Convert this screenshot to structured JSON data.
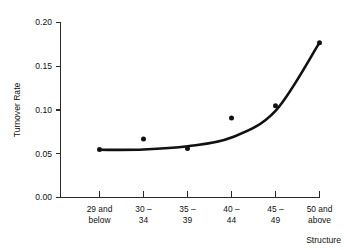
{
  "chart_data": {
    "type": "scatter",
    "title": "",
    "xlabel": "Structure",
    "ylabel": "Turnover Rate",
    "categories": [
      "29 and below",
      "30 – 34",
      "35 – 39",
      "40 – 44",
      "45 – 49",
      "50 and above"
    ],
    "category_lines": [
      [
        "29 and",
        "below"
      ],
      [
        "30 –",
        "34"
      ],
      [
        "35 –",
        "39"
      ],
      [
        "40 –",
        "44"
      ],
      [
        "45 –",
        "49"
      ],
      [
        "50 and",
        "above"
      ]
    ],
    "values": [
      0.055,
      0.067,
      0.056,
      0.091,
      0.105,
      0.177
    ],
    "series": [
      {
        "name": "Turnover Rate",
        "marker": "filled-circle",
        "values": [
          0.055,
          0.067,
          0.056,
          0.091,
          0.105,
          0.177
        ]
      },
      {
        "name": "Fitted curve",
        "type": "line",
        "values": [
          0.0545,
          0.0548,
          0.0585,
          0.0685,
          0.099,
          0.177
        ]
      }
    ],
    "ylim": [
      0.0,
      0.2
    ],
    "xlim": [
      0,
      5
    ],
    "yticks": [
      0.0,
      0.05,
      0.1,
      0.15,
      0.2
    ],
    "ytick_labels": [
      "0.00",
      "0.05",
      "0.10",
      "0.15",
      "0.20"
    ],
    "grid": false,
    "legend": null,
    "legend_position": "none",
    "annotations": []
  },
  "colors": {
    "background": "#ffffff",
    "axis": "#2b2b2b",
    "marker": "#111111",
    "curve": "#111111",
    "text": "#111111"
  }
}
